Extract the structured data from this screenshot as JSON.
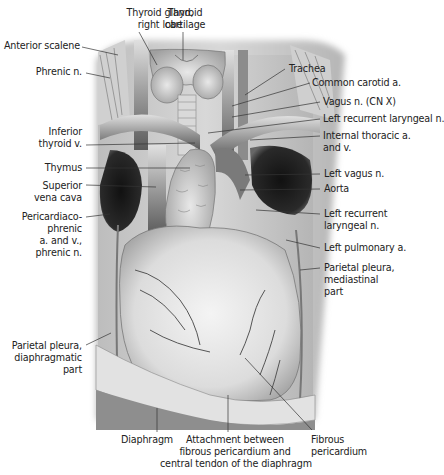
{
  "figure": {
    "labels_left": [
      {
        "id": "anterior-scalene",
        "text": "Anterior scalene"
      },
      {
        "id": "phrenic-n",
        "text": "Phrenic n."
      },
      {
        "id": "inferior-thyroid-v",
        "text": "Inferior\nthyroid v."
      },
      {
        "id": "thymus",
        "text": "Thymus"
      },
      {
        "id": "superior-vena-cava",
        "text": "Superior\nvena cava"
      },
      {
        "id": "pericardiacophrenic",
        "text": "Pericardiaco-\nphrenic\na. and v.,\nphrenic n."
      },
      {
        "id": "parietal-pleura-diaphragmatic",
        "text": "Parietal pleura,\ndiaphragmatic\npart"
      }
    ],
    "labels_top": [
      {
        "id": "thyroid-gland-right-lobe",
        "text": "Thyroid gland,\nright lobe"
      },
      {
        "id": "thyroid-cartilage",
        "text": "Thyroid\ncartilage"
      }
    ],
    "labels_right": [
      {
        "id": "trachea",
        "text": "Trachea"
      },
      {
        "id": "common-carotid-a",
        "text": "Common carotid a."
      },
      {
        "id": "vagus-n",
        "text": "Vagus n. (CN X)"
      },
      {
        "id": "left-recurrent-laryngeal-n-upper",
        "text": "Left recurrent laryngeal n."
      },
      {
        "id": "internal-thoracic",
        "text": "Internal thoracic a.\nand v."
      },
      {
        "id": "left-vagus-n",
        "text": "Left vagus n."
      },
      {
        "id": "aorta",
        "text": "Aorta"
      },
      {
        "id": "left-recurrent-laryngeal-n-lower",
        "text": "Left recurrent\nlaryngeal n."
      },
      {
        "id": "left-pulmonary-a",
        "text": "Left pulmonary a."
      },
      {
        "id": "parietal-pleura-mediastinal",
        "text": "Parietal pleura,\nmediastinal\npart"
      }
    ],
    "labels_bottom": [
      {
        "id": "diaphragm",
        "text": "Diaphragm"
      },
      {
        "id": "attachment",
        "text": "Attachment between\nfibrous pericardium and\ncentral tendon of the diaphragm"
      },
      {
        "id": "fibrous-pericardium",
        "text": "Fibrous\npericardium"
      }
    ]
  }
}
